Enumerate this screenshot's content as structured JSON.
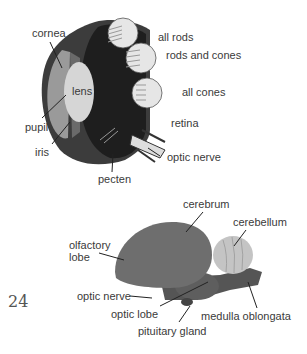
{
  "page_number": "24",
  "eye_diagram": {
    "labels": {
      "cornea": "cornea",
      "lens": "lens",
      "pupil": "pupil",
      "iris": "iris",
      "pecten": "pecten",
      "all_rods": "all rods",
      "rods_and_cones": "rods and cones",
      "all_cones": "all cones",
      "retina": "retina",
      "optic_nerve": "optic nerve"
    }
  },
  "brain_diagram": {
    "labels": {
      "cerebrum": "cerebrum",
      "cerebellum": "cerebellum",
      "olfactory_lobe_1": "olfactory",
      "olfactory_lobe_2": "lobe",
      "optic_nerve": "optic nerve",
      "optic_lobe": "optic lobe",
      "pituitary_gland": "pituitary gland",
      "medulla_oblongata": "medulla oblongata"
    }
  },
  "colors": {
    "eye_dark": "#1e1e1e",
    "eye_outer": "#3c3c3c",
    "cornea_fill": "#9a9a9a",
    "lens_fill": "#d6d6d6",
    "brain_fill": "#6e6e6e",
    "cerebellum_fill": "#c4c4c4"
  }
}
